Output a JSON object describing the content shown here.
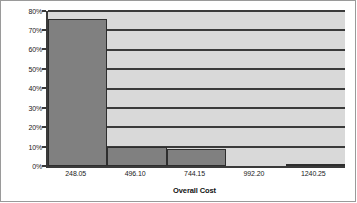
{
  "chart_data": {
    "type": "bar",
    "title": "",
    "subtitle": "",
    "xlabel": "Overall Cost",
    "ylabel": "",
    "categories": [
      "248.05",
      "496.10",
      "744.15",
      "992.20",
      "1240.25"
    ],
    "values": [
      76,
      10,
      9,
      0,
      1
    ],
    "ylim": [
      0,
      80
    ],
    "ytick_labels": [
      "80%",
      "70%",
      "60%",
      "50%",
      "40%",
      "30%",
      "20%",
      "10%",
      "0%"
    ],
    "ytick_values": [
      80,
      70,
      60,
      50,
      40,
      30,
      20,
      10,
      0
    ],
    "ytick_step": 10,
    "grid": true,
    "grid_axis": "y",
    "legend": false,
    "legend_position": "none",
    "bar_fill_color": "#808080",
    "bar_border_color": "#2e2e2e",
    "plot_background_color": "#d9d9d9",
    "axis_color": "#3a3a3a",
    "frame_border_color": "#9a9a9a",
    "annotations": []
  }
}
